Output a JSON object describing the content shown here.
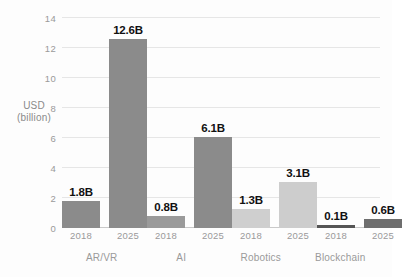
{
  "chart_data": {
    "type": "bar",
    "title": "",
    "subtitle": "",
    "xlabel": "",
    "ylabel": "USD (billion)",
    "ylabel_line1": "USD",
    "ylabel_line2": "(billion)",
    "ylim": [
      0,
      14
    ],
    "yticks": [
      14,
      12,
      10,
      8,
      6,
      4,
      2,
      0
    ],
    "grid": true,
    "legend": "none",
    "categories": [
      "AR/VR",
      "AI",
      "Robotics",
      "Blockchain"
    ],
    "x": [
      "2018",
      "2025"
    ],
    "series": [
      {
        "name": "2018",
        "values": [
          1.8,
          0.8,
          1.3,
          0.1
        ]
      },
      {
        "name": "2025",
        "values": [
          12.6,
          6.1,
          3.1,
          0.6
        ]
      }
    ],
    "groups": [
      {
        "category": "AR/VR",
        "bars": [
          {
            "year": "2018",
            "value": 1.8,
            "label": "1.8B",
            "color": "#8b8b8b"
          },
          {
            "year": "2025",
            "value": 12.6,
            "label": "12.6B",
            "color": "#8b8b8b"
          }
        ]
      },
      {
        "category": "AI",
        "bars": [
          {
            "year": "2018",
            "value": 0.8,
            "label": "0.8B",
            "color": "#9a9a9a"
          },
          {
            "year": "2025",
            "value": 6.1,
            "label": "6.1B",
            "color": "#8b8b8b"
          }
        ]
      },
      {
        "category": "Robotics",
        "bars": [
          {
            "year": "2018",
            "value": 1.3,
            "label": "1.3B",
            "color": "#cfcfcf"
          },
          {
            "year": "2025",
            "value": 3.1,
            "label": "3.1B",
            "color": "#cdcdcd"
          }
        ]
      },
      {
        "category": "Blockchain",
        "bars": [
          {
            "year": "2018",
            "value": 0.1,
            "label": "0.1B",
            "color": "#555555"
          },
          {
            "year": "2025",
            "value": 0.6,
            "label": "0.6B",
            "color": "#6e6e6e"
          }
        ]
      }
    ],
    "colors": {
      "background": "#fdfdfd",
      "gridline": "#e6e6e6",
      "baseline": "#c9c9c9",
      "tick_text": "#9a9a9a",
      "data_label": "#111111"
    }
  }
}
